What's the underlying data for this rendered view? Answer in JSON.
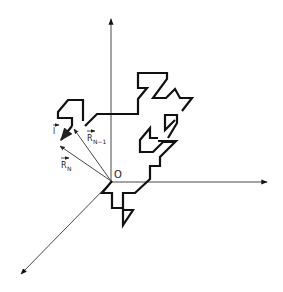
{
  "figure": {
    "origin_label": "O",
    "labels": {
      "step_vector": "l",
      "position_prev": "R",
      "position_prev_sub": "N−1",
      "position_curr": "R",
      "position_curr_sub": "N"
    },
    "axes": [
      "vertical-axis",
      "horizontal-axis",
      "depth-axis"
    ],
    "colors": {
      "line": "#111111",
      "axis": "#333333",
      "background": "#ffffff"
    }
  }
}
